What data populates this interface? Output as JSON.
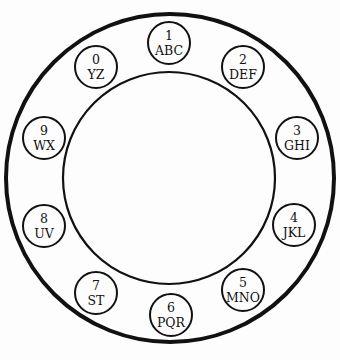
{
  "diagram": {
    "colors": {
      "stroke": "#111111",
      "background": "#fdfdfd"
    },
    "outer_ring": {
      "cx": 170,
      "cy": 178,
      "r": 164,
      "stroke_width": 4
    },
    "inner_ring": {
      "cx": 169,
      "cy": 178,
      "r": 106,
      "stroke_width": 2.2
    },
    "keys": [
      {
        "digit": "1",
        "letters": "ABC",
        "cx": 169,
        "cy": 43
      },
      {
        "digit": "2",
        "letters": "DEF",
        "cx": 243,
        "cy": 67
      },
      {
        "digit": "3",
        "letters": "GHI",
        "cx": 297,
        "cy": 138
      },
      {
        "digit": "4",
        "letters": "JKL",
        "cx": 294,
        "cy": 225
      },
      {
        "digit": "5",
        "letters": "MNO",
        "cx": 243,
        "cy": 290
      },
      {
        "digit": "6",
        "letters": "PQR",
        "cx": 171,
        "cy": 315
      },
      {
        "digit": "7",
        "letters": "ST",
        "cx": 96,
        "cy": 293
      },
      {
        "digit": "8",
        "letters": "UV",
        "cx": 44,
        "cy": 226
      },
      {
        "digit": "9",
        "letters": "WX",
        "cx": 44,
        "cy": 138
      },
      {
        "digit": "0",
        "letters": "YZ",
        "cx": 96,
        "cy": 67
      }
    ]
  }
}
